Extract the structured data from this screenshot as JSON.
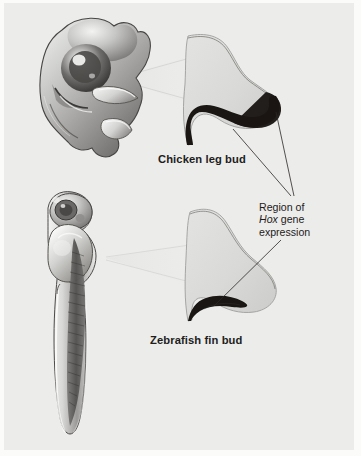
{
  "figure": {
    "background_color": "#fbfbfa",
    "panel_color": "#ececeb",
    "bud_fill_color": "#dcdcda",
    "bud_outline_color": "#8d8d8b",
    "expression_color": "#1a1614",
    "leader_line_color": "#2b2724",
    "embryo_light": "#f2f2f1",
    "embryo_mid": "#b4b4b2",
    "embryo_dark": "#5c5a58"
  },
  "labels": {
    "chicken": "Chicken leg bud",
    "zebrafish": "Zebrafish fin bud",
    "annotation_line1": "Region of",
    "annotation_gene": "Hox",
    "annotation_line2_rest": " gene",
    "annotation_line3": "expression"
  },
  "diagram_data": {
    "type": "labeled-illustration",
    "subject": "Hox gene expression domains in vertebrate limb and fin buds",
    "specimens": [
      {
        "name": "Chicken leg bud",
        "embryo_label": "chicken embryo",
        "embryo_position": "upper-left",
        "bud_position": "upper-right",
        "expression_extent": "large",
        "expression_description": "thick dark crescent sweeping along the posterior margin and expanding at the distal tip"
      },
      {
        "name": "Zebrafish fin bud",
        "embryo_label": "zebrafish larva",
        "embryo_position": "lower-left",
        "bud_position": "lower-right",
        "expression_extent": "small",
        "expression_description": "thin dark sliver restricted to the ventral-posterior base of the bud"
      }
    ],
    "callouts": [
      {
        "from": "chicken bud distal tip",
        "to": "Region of Hox gene expression"
      },
      {
        "from": "chicken bud posterior band",
        "to": "Region of Hox gene expression"
      },
      {
        "from": "Region of Hox gene expression",
        "to": "zebrafish bud sliver"
      }
    ]
  }
}
